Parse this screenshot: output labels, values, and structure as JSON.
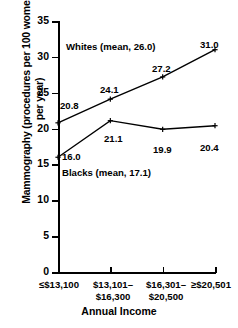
{
  "chart_data": {
    "type": "line",
    "title": "",
    "xlabel": "Annual Income",
    "ylabel": "Mammography (procedures per 100 women per year)",
    "categories": [
      "≤$13,100",
      "$13,101–\n$16,300",
      "$16,301–\n$20,500",
      "≥$20,501"
    ],
    "ylim": [
      0,
      35
    ],
    "yticks": [
      "0",
      "5",
      "10",
      "15",
      "20",
      "25",
      "30",
      "35"
    ],
    "grid": false,
    "legend": "inline-annotations",
    "series": [
      {
        "name": "Whites",
        "annotation": "Whites (mean, 26.0)",
        "mean": 26.0,
        "values": [
          20.8,
          24.1,
          27.2,
          31.0
        ],
        "labels": [
          "20.8",
          "24.1",
          "27.2",
          "31.0"
        ],
        "color": "#000000"
      },
      {
        "name": "Blacks",
        "annotation": "Blacks (mean, 17.1)",
        "mean": 17.1,
        "values": [
          16.0,
          21.1,
          19.9,
          20.4
        ],
        "labels": [
          "16.0",
          "21.1",
          "19.9",
          "20.4"
        ],
        "color": "#000000"
      }
    ]
  },
  "axes": {
    "ylabel": "Mammography (procedures per\n100 women per year)",
    "xlabel": "Annual Income"
  }
}
